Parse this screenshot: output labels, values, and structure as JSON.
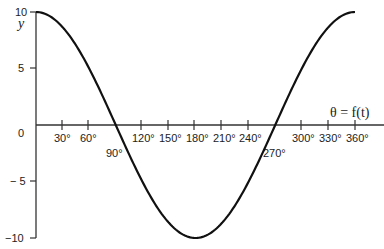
{
  "chart_data": {
    "type": "line",
    "title": "",
    "xlabel": "θ = f(t)",
    "ylabel": "y",
    "xlim": [
      0,
      360
    ],
    "ylim": [
      -10,
      10
    ],
    "grid": false,
    "legend": null,
    "x_ticks": [
      30,
      60,
      90,
      120,
      150,
      180,
      210,
      240,
      270,
      300,
      330,
      360
    ],
    "x_tick_labels": [
      "30°",
      "60°",
      "90°",
      "120°",
      "150°",
      "180°",
      "210°",
      "240°",
      "270°",
      "300°",
      "330°",
      "360°"
    ],
    "y_ticks": [
      10,
      5,
      0,
      -5,
      -10
    ],
    "y_tick_labels": [
      "10",
      "5",
      "0",
      "− 5",
      "−10"
    ],
    "series": [
      {
        "name": "y = 10 cos θ",
        "x": [
          0,
          30,
          60,
          90,
          120,
          150,
          180,
          210,
          240,
          270,
          300,
          330,
          360
        ],
        "values": [
          10,
          8.66,
          5,
          0,
          -5,
          -8.66,
          -10,
          -8.66,
          -5,
          0,
          5,
          8.66,
          10
        ]
      }
    ]
  },
  "labels": {
    "y_axis": "y",
    "x_axis": "θ = f(t)",
    "origin": "0",
    "y10": "10",
    "y5": "5",
    "yneg5": "− 5",
    "yneg10": "−10",
    "x30": "30°",
    "x60": "60°",
    "x90": "90°",
    "x120": "120°",
    "x150": "150°",
    "x180": "180°",
    "x210": "210°",
    "x240": "240°",
    "x270": "270°",
    "x300": "300°",
    "x330": "330°",
    "x360": "360°"
  }
}
